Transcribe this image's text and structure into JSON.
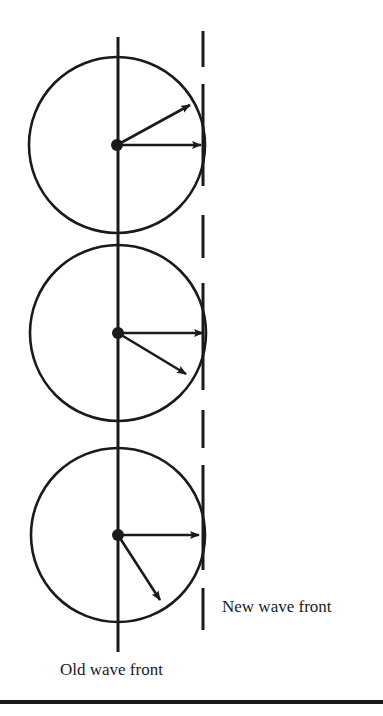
{
  "diagram": {
    "type": "huygens-wavelets",
    "labels": {
      "old_wave_front": "Old wave front",
      "new_wave_front": "New wave front"
    },
    "old_wave_front_line": {
      "x": 118,
      "y1": 37,
      "y2": 652
    },
    "new_wave_front_dashes": {
      "x": 203,
      "segments": [
        [
          31,
          67
        ],
        [
          84,
          186
        ],
        [
          215,
          258
        ],
        [
          283,
          390
        ],
        [
          410,
          448
        ],
        [
          465,
          570
        ],
        [
          588,
          630
        ]
      ]
    },
    "wavelets": [
      {
        "cx": 117,
        "cy": 145,
        "r": 88,
        "arrows": [
          {
            "x2": 190,
            "y2": 105
          },
          {
            "x2": 201,
            "y2": 145
          }
        ]
      },
      {
        "cx": 118,
        "cy": 333,
        "r": 88,
        "arrows": [
          {
            "x2": 203,
            "y2": 333
          },
          {
            "x2": 186,
            "y2": 374
          }
        ]
      },
      {
        "cx": 118,
        "cy": 535,
        "r": 87,
        "arrows": [
          {
            "x2": 199,
            "y2": 535
          },
          {
            "x2": 160,
            "y2": 600
          }
        ]
      }
    ],
    "bottom_rule": {
      "y": 702,
      "thickness": 4
    },
    "colors": {
      "ink": "#1a1a1a",
      "background": "#ffffff"
    }
  }
}
